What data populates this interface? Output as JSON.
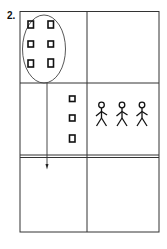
{
  "figure": {
    "label": "2.",
    "grid": {
      "rows": 3,
      "cols": 2,
      "row2_row3_separator": "double"
    },
    "cells": {
      "top_left": {
        "content": "oval enclosing 6 squares (2 columns x 3 rows)",
        "squares": 6
      },
      "top_right": {
        "content": "empty"
      },
      "middle_left": {
        "content": "column of 3 squares; arrow line passes down from oval",
        "squares": 3
      },
      "middle_right": {
        "content": "3 stick figures",
        "figures": 3
      },
      "bottom_left": {
        "content": "arrowhead pointing down"
      },
      "bottom_right": {
        "content": "empty"
      }
    },
    "colors": {
      "line": "#333333",
      "shape": "#111111",
      "background": "#ffffff"
    }
  }
}
